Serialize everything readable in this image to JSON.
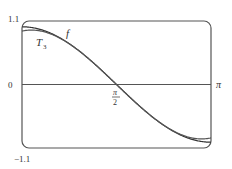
{
  "chart_data": {
    "type": "line",
    "title": "",
    "xlabel": "",
    "ylabel": "",
    "xlim": [
      0,
      3.14159
    ],
    "ylim": [
      -1.1,
      1.1
    ],
    "grid": false,
    "x_tick_labels": [
      "0",
      "π/2",
      "π"
    ],
    "y_tick_labels": [
      "1.1",
      "0",
      "-1.1"
    ],
    "series": [
      {
        "name": "f",
        "label": "f",
        "description": "cos(x)"
      },
      {
        "name": "T3",
        "label": "T₃",
        "description": "Taylor polynomial of degree 3 about π/2"
      }
    ],
    "annotations": [
      {
        "text": "f",
        "x": 0.75,
        "y": 0.95
      },
      {
        "text": "T3",
        "x": 0.3,
        "y": 0.7
      },
      {
        "text": "π/2",
        "x": 1.5708,
        "y": -0.2
      }
    ]
  },
  "labels": {
    "y_top": "1.1",
    "y_zero": "0",
    "y_bottom": "−1.1",
    "x_pi": "π",
    "x_half_pi_num": "π",
    "x_half_pi_den": "2",
    "f": "f",
    "t3_main": "T",
    "t3_sub": "3"
  },
  "colors": {
    "curve": "#333333",
    "frame": "#555555",
    "axis": "#555555"
  }
}
